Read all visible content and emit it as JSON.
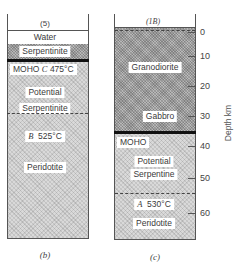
{
  "columns": [
    {
      "id": "b",
      "header": "(5)",
      "caption": "(b)",
      "layers": [
        {
          "name": "Water",
          "fill": "white"
        },
        {
          "name": "Serpentinite",
          "fill": "dark-hatch"
        },
        {
          "name": "Potential Serpentinite",
          "fill": "light-stipple"
        },
        {
          "name": "Peridotite",
          "fill": "light-stipple"
        }
      ],
      "labels": {
        "water": "Water",
        "serpentinite": "Serpentinite",
        "moho_prefix": "MOHO",
        "moho_point": "C",
        "moho_temp": "475°C",
        "potential": "Potential",
        "serpentinite2": "Serpentinite",
        "b_point": "B",
        "b_temp": "525°C",
        "peridotite": "Peridotite"
      }
    },
    {
      "id": "c",
      "header": "(1B)",
      "caption": "(c)",
      "layers": [
        {
          "name": "Granodiorite",
          "fill": "dark-hatch"
        },
        {
          "name": "Gabbro",
          "fill": "dark-hatch"
        },
        {
          "name": "Potential Serpentine",
          "fill": "light-stipple"
        },
        {
          "name": "Peridotite",
          "fill": "light-stipple"
        }
      ],
      "labels": {
        "granodiorite": "Granodiorite",
        "gabbro": "Gabbro",
        "moho": "MOHO",
        "potential": "Potential",
        "serpentine": "Serpentine",
        "a_point": "A",
        "a_temp": "530°C",
        "peridotite": "Peridotite"
      }
    }
  ],
  "axis": {
    "title": "Depth km",
    "ticks": [
      "0",
      "10",
      "20",
      "30",
      "40",
      "50",
      "60"
    ]
  },
  "colors": {
    "line": "#555555",
    "moho_line": "#111111",
    "light_fill": "#d9d9d9",
    "dark_fill": "#b8b8b8"
  }
}
